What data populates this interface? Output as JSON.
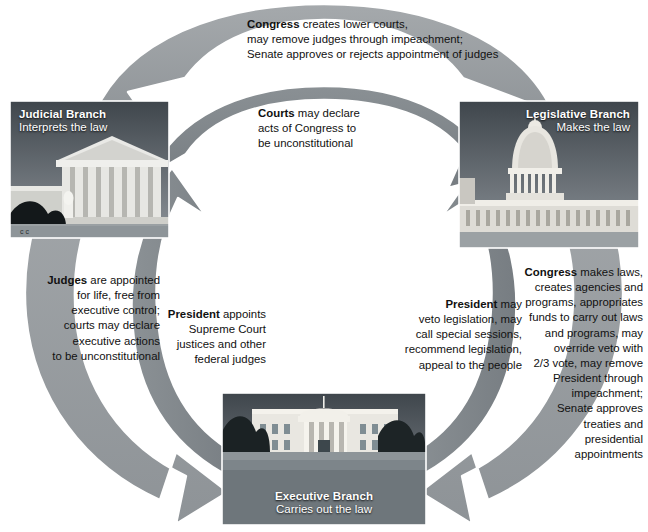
{
  "diagram": {
    "colors": {
      "outer_ribbon": "#9a9ea1",
      "inner_ribbon": "#7e8488",
      "ribbon_outline": "#ffffff",
      "background": "#ffffff",
      "caption_text": "#ffffff",
      "body_text": "#111111"
    }
  },
  "branches": {
    "judicial": {
      "name": "Judicial Branch",
      "role": "Interprets the law",
      "image": "supreme-court-building-photo"
    },
    "legislative": {
      "name": "Legislative Branch",
      "role": "Makes the law",
      "image": "us-capitol-building-photo"
    },
    "executive": {
      "name": "Executive Branch",
      "role": "Carries out the law",
      "image": "white-house-photo"
    }
  },
  "flows": {
    "congress_over_courts": {
      "lead": "Congress",
      "rest": " creates lower courts, may remove judges through impeachment; Senate approves or rejects appointment of judges",
      "lines": [
        "Congress creates lower courts,",
        "may remove judges through impeachment;",
        "Senate approves or rejects appointment of judges"
      ],
      "from": "legislative",
      "to": "judicial"
    },
    "courts_over_congress": {
      "lead": "Courts",
      "rest": " may declare acts of Congress to be unconstitutional",
      "lines": [
        "Courts may declare",
        "acts of Congress to",
        "be unconstitutional"
      ],
      "from": "judicial",
      "to": "legislative"
    },
    "judges_over_president": {
      "lead": "Judges",
      "rest": " are appointed for life, free from executive control; courts may declare executive actions to be unconstitutional",
      "lines": [
        "Judges are appointed",
        "for life, free from",
        "executive control;",
        "courts may declare",
        "executive actions",
        "to be unconstitutional"
      ],
      "from": "judicial",
      "to": "executive"
    },
    "president_over_courts": {
      "lead": "President",
      "rest": " appoints Supreme Court justices and other federal judges",
      "lines": [
        "President appoints",
        "Supreme Court",
        "justices and other",
        "federal judges"
      ],
      "from": "executive",
      "to": "judicial"
    },
    "president_over_congress": {
      "lead": "President",
      "rest": " may veto legislation, may call special sessions, recommend legislation, appeal to the people",
      "lines": [
        "President may",
        "veto legislation, may",
        "call special sessions,",
        "recommend legislation,",
        "appeal to the people"
      ],
      "from": "executive",
      "to": "legislative"
    },
    "congress_over_president": {
      "lead": "Congress",
      "rest": " makes laws, creates agencies and programs, appropriates funds to carry out laws and programs, may override veto with 2/3 vote, may remove President through impeachment; Senate approves treaties and presidential appointments",
      "lines": [
        "Congress makes laws,",
        "creates agencies and",
        "programs, appropriates",
        "funds to carry out laws",
        "and programs, may",
        "override veto with",
        "2/3 vote, may remove",
        "President through",
        "impeachment;",
        "Senate approves",
        "treaties and",
        "presidential",
        "appointments"
      ],
      "from": "legislative",
      "to": "executive"
    }
  }
}
